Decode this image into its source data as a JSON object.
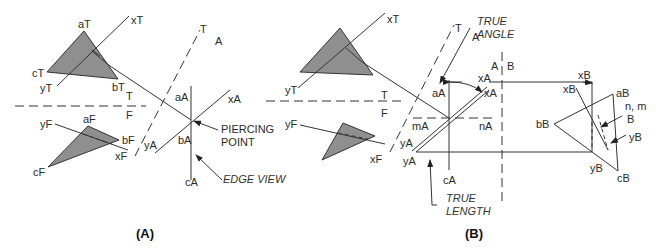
{
  "colors": {
    "triangle_fill": "#8f8f8f",
    "line": "#333333",
    "background": "#ffffff"
  },
  "panelA": {
    "caption": "(A)",
    "labels": {
      "aT": "aT",
      "bT": "bT",
      "cT": "cT",
      "xT": "xT",
      "yT": "yT",
      "fold_T": "T",
      "fold_F": "F",
      "aF": "aF",
      "bF": "bF",
      "cF": "cF",
      "xF": "xF",
      "yF": "yF",
      "fold_T2": "T",
      "fold_A": "A",
      "aA": "aA",
      "bA": "bA",
      "cA": "cA",
      "xA": "xA",
      "yA": "yA"
    },
    "callouts": {
      "piercing_1": "PIERCING",
      "piercing_2": "POINT",
      "edge_view": "EDGE VIEW"
    }
  },
  "panelB": {
    "caption": "(B)",
    "labels": {
      "xT": "xT",
      "yT": "yT",
      "fold_T": "T",
      "fold_F": "F",
      "xF": "xF",
      "yF": "yF",
      "fold_T2": "T",
      "fold_A": "A",
      "aA": "aA",
      "cA": "cA",
      "mA": "mA",
      "nA": "nA",
      "xA_1": "xA",
      "xA_2": "xA",
      "yA_1": "yA",
      "yA_2": "yA",
      "fold_A2": "A",
      "fold_B": "B",
      "aB": "aB",
      "bB": "bB",
      "cB": "cB",
      "xB_1": "xB",
      "xB_2": "xB",
      "yB_1": "yB",
      "yB_2": "yB",
      "nm": "n, m",
      "B": "B"
    },
    "callouts": {
      "true_angle_1": "TRUE",
      "true_angle_2": "ANGLE",
      "true_length_1": "TRUE",
      "true_length_2": "LENGTH"
    }
  }
}
